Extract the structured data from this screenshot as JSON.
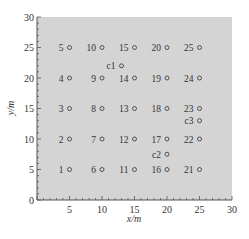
{
  "chart_data": {
    "type": "scatter",
    "title": "",
    "xlabel": "x/m",
    "ylabel": "y/m",
    "xlim": [
      0,
      30
    ],
    "ylim": [
      0,
      30
    ],
    "x_ticks": [
      5,
      10,
      15,
      20,
      25,
      30
    ],
    "y_ticks": [
      0,
      5,
      10,
      15,
      20,
      25,
      30
    ],
    "grid": false,
    "background_color": "#d4d4d4",
    "legend": null,
    "series": [
      {
        "name": "measurement points",
        "marker": "open-circle",
        "points": [
          {
            "label": "1",
            "x": 5,
            "y": 5
          },
          {
            "label": "2",
            "x": 5,
            "y": 10
          },
          {
            "label": "3",
            "x": 5,
            "y": 15
          },
          {
            "label": "4",
            "x": 5,
            "y": 20
          },
          {
            "label": "5",
            "x": 5,
            "y": 25
          },
          {
            "label": "6",
            "x": 10,
            "y": 5
          },
          {
            "label": "7",
            "x": 10,
            "y": 10
          },
          {
            "label": "8",
            "x": 10,
            "y": 15
          },
          {
            "label": "9",
            "x": 10,
            "y": 20
          },
          {
            "label": "10",
            "x": 10,
            "y": 25
          },
          {
            "label": "11",
            "x": 15,
            "y": 5
          },
          {
            "label": "12",
            "x": 15,
            "y": 10
          },
          {
            "label": "13",
            "x": 15,
            "y": 15
          },
          {
            "label": "14",
            "x": 15,
            "y": 20
          },
          {
            "label": "15",
            "x": 15,
            "y": 25
          },
          {
            "label": "16",
            "x": 20,
            "y": 5
          },
          {
            "label": "17",
            "x": 20,
            "y": 10
          },
          {
            "label": "18",
            "x": 20,
            "y": 15
          },
          {
            "label": "19",
            "x": 20,
            "y": 20
          },
          {
            "label": "20",
            "x": 20,
            "y": 25
          },
          {
            "label": "21",
            "x": 25,
            "y": 5
          },
          {
            "label": "22",
            "x": 25,
            "y": 10
          },
          {
            "label": "23",
            "x": 25,
            "y": 15
          },
          {
            "label": "24",
            "x": 25,
            "y": 20
          },
          {
            "label": "25",
            "x": 25,
            "y": 25
          }
        ]
      },
      {
        "name": "c points",
        "marker": "open-circle",
        "points": [
          {
            "label": "c1",
            "x": 13,
            "y": 22
          },
          {
            "label": "c2",
            "x": 20,
            "y": 7.5
          },
          {
            "label": "c3",
            "x": 25,
            "y": 13
          }
        ]
      }
    ]
  }
}
